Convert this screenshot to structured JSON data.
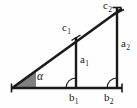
{
  "figure": {
    "background_color": "#fefefe",
    "stroke_color": "#1a1a1a",
    "angle_fill_color": "#808080",
    "labels": {
      "angle": "α",
      "hyp_small_base": "c",
      "hyp_small_sub": "1",
      "hyp_large_base": "c",
      "hyp_large_sub": "2",
      "opp_small_base": "a",
      "opp_small_sub": "1",
      "opp_large_base": "a",
      "opp_large_sub": "2",
      "adj_small_base": "b",
      "adj_small_sub": "1",
      "adj_large_base": "b",
      "adj_large_sub": "2"
    },
    "geometry": {
      "origin": [
        12,
        88
      ],
      "apex": [
        117,
        12
      ],
      "inner_foot": [
        76,
        88
      ],
      "inner_top": [
        76,
        38
      ],
      "baseline_end": [
        122,
        88
      ],
      "angle_degrees": 36
    }
  }
}
